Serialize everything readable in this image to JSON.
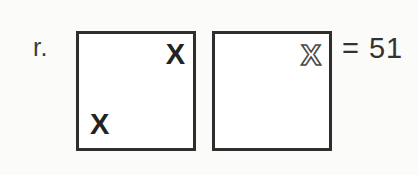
{
  "problem": {
    "label": "r.",
    "result_expression": "= 51",
    "equals_sign": "=",
    "result_value": "51"
  },
  "colors": {
    "background": "#fbfbfa",
    "box_fill": "#ffffff",
    "box_border": "#2e2e2e",
    "solid_mark": "#222222",
    "hollow_mark_stroke": "#4a4a4a",
    "text": "#333333"
  },
  "boxes": [
    {
      "name": "square-one",
      "marks": [
        {
          "glyph": "X",
          "style": "solid",
          "position": "top-right"
        },
        {
          "glyph": "X",
          "style": "solid",
          "position": "bottom-left"
        }
      ]
    },
    {
      "name": "square-two",
      "marks": [
        {
          "glyph": "X",
          "style": "hollow",
          "position": "top-right"
        }
      ]
    }
  ],
  "chart_data": {
    "type": "table",
    "title": "r.",
    "categories": [
      "square-one",
      "square-two"
    ],
    "values": [
      2,
      1
    ],
    "series": [
      {
        "name": "solid X marks",
        "values": [
          2,
          0
        ]
      },
      {
        "name": "hollow X marks",
        "values": [
          0,
          1
        ]
      }
    ],
    "annotations": [
      "= 51"
    ],
    "xlabel": "",
    "ylabel": ""
  }
}
